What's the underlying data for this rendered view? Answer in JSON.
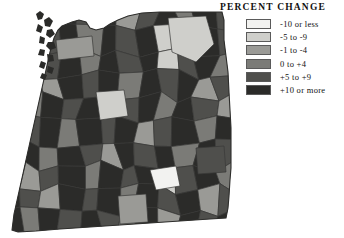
{
  "legend": {
    "title": "PERCENT CHANGE",
    "classes": [
      {
        "label": "-10 or less",
        "color": "#f2f2f0",
        "key": "c1"
      },
      {
        "label": "-5 to -9",
        "color": "#cfcfcb",
        "key": "c2"
      },
      {
        "label": "-1 to -4",
        "color": "#9a9a96",
        "key": "c3"
      },
      {
        "label": "0 to +4",
        "color": "#7b7b77",
        "key": "c4"
      },
      {
        "label": "+5 to +9",
        "color": "#4f4f4c",
        "key": "c5"
      },
      {
        "label": "+10 or more",
        "color": "#2b2b29",
        "key": "c6"
      }
    ]
  },
  "map": {
    "region": "Pacific Northwest counties",
    "background": "#ffffff",
    "border_color": "#3a3a38",
    "chart_data": {
      "type": "map",
      "title": "PERCENT CHANGE",
      "classes": [
        "-10 or less",
        "-5 to -9",
        "-1 to -4",
        "0 to +4",
        "+5 to +9",
        "+10 or more"
      ],
      "class_colors": [
        "#f2f2f0",
        "#cfcfcb",
        "#9a9a96",
        "#7b7b77",
        "#4f4f4c",
        "#2b2b29"
      ],
      "legend_position": "top-right",
      "regions": [
        {
          "id": "r01",
          "class": 5
        },
        {
          "id": "r02",
          "class": 1
        },
        {
          "id": "r03",
          "class": 4
        },
        {
          "id": "r04",
          "class": 5
        },
        {
          "id": "r05",
          "class": 4
        },
        {
          "id": "r06",
          "class": 5
        },
        {
          "id": "r07",
          "class": 2
        },
        {
          "id": "r08",
          "class": 4
        },
        {
          "id": "r09",
          "class": 5
        },
        {
          "id": "r10",
          "class": 3
        },
        {
          "id": "r11",
          "class": 5
        },
        {
          "id": "r12",
          "class": 4
        },
        {
          "id": "r13",
          "class": 5
        },
        {
          "id": "r14",
          "class": 2
        },
        {
          "id": "r15",
          "class": 4
        },
        {
          "id": "r16",
          "class": 5
        },
        {
          "id": "r17",
          "class": 3
        },
        {
          "id": "r18",
          "class": 5
        },
        {
          "id": "r19",
          "class": 4
        },
        {
          "id": "r20",
          "class": 5
        },
        {
          "id": "r21",
          "class": 1
        },
        {
          "id": "r22",
          "class": 3
        },
        {
          "id": "r23",
          "class": 5
        },
        {
          "id": "r24",
          "class": 4
        },
        {
          "id": "r25",
          "class": 5
        },
        {
          "id": "r26",
          "class": 2
        },
        {
          "id": "r27",
          "class": 4
        },
        {
          "id": "r28",
          "class": 5
        },
        {
          "id": "r29",
          "class": 3
        },
        {
          "id": "r30",
          "class": 5
        },
        {
          "id": "r31",
          "class": 4
        },
        {
          "id": "r32",
          "class": 5
        },
        {
          "id": "r33",
          "class": 1
        },
        {
          "id": "r34",
          "class": 4
        },
        {
          "id": "r35",
          "class": 5
        },
        {
          "id": "r36",
          "class": 3
        },
        {
          "id": "r37",
          "class": 5
        },
        {
          "id": "r38",
          "class": 4
        },
        {
          "id": "r39",
          "class": 2
        },
        {
          "id": "r40",
          "class": 5
        },
        {
          "id": "r41",
          "class": 4
        },
        {
          "id": "r42",
          "class": 5
        },
        {
          "id": "r43",
          "class": 3
        },
        {
          "id": "r44",
          "class": 5
        },
        {
          "id": "r45",
          "class": 4
        },
        {
          "id": "r46",
          "class": 5
        },
        {
          "id": "r47",
          "class": 2
        },
        {
          "id": "r48",
          "class": 4
        },
        {
          "id": "r49",
          "class": 5
        },
        {
          "id": "r50",
          "class": 3
        },
        {
          "id": "r51",
          "class": 5
        },
        {
          "id": "r52",
          "class": 4
        },
        {
          "id": "r53",
          "class": 5
        },
        {
          "id": "r54",
          "class": 1
        },
        {
          "id": "r55",
          "class": 4
        },
        {
          "id": "r56",
          "class": 5
        },
        {
          "id": "r57",
          "class": 3
        },
        {
          "id": "r58",
          "class": 5
        },
        {
          "id": "r59",
          "class": 4
        },
        {
          "id": "r60",
          "class": 2
        },
        {
          "id": "r61",
          "class": 5
        },
        {
          "id": "r62",
          "class": 4
        },
        {
          "id": "r63",
          "class": 5
        },
        {
          "id": "r64",
          "class": 3
        },
        {
          "id": "r65",
          "class": 5
        },
        {
          "id": "r66",
          "class": 4
        },
        {
          "id": "r67",
          "class": 5
        },
        {
          "id": "r68",
          "class": 2
        },
        {
          "id": "r69",
          "class": 4
        },
        {
          "id": "r70",
          "class": 5
        },
        {
          "id": "r71",
          "class": 3
        },
        {
          "id": "r72",
          "class": 5
        },
        {
          "id": "r73",
          "class": 4
        },
        {
          "id": "r74",
          "class": 5
        },
        {
          "id": "r75",
          "class": 3
        },
        {
          "id": "r76",
          "class": 5
        },
        {
          "id": "r77",
          "class": 4
        },
        {
          "id": "r78",
          "class": 2
        },
        {
          "id": "r79",
          "class": 5
        },
        {
          "id": "r80",
          "class": 4
        },
        {
          "id": "r81",
          "class": 5
        },
        {
          "id": "r82",
          "class": 3
        },
        {
          "id": "r83",
          "class": 5
        },
        {
          "id": "r84",
          "class": 4
        },
        {
          "id": "r85",
          "class": 5
        },
        {
          "id": "r86",
          "class": 2
        },
        {
          "id": "r87",
          "class": 4
        },
        {
          "id": "r88",
          "class": 5
        },
        {
          "id": "r89",
          "class": 3
        },
        {
          "id": "r90",
          "class": 5
        },
        {
          "id": "r91",
          "class": 4
        },
        {
          "id": "r92",
          "class": 5
        },
        {
          "id": "r93",
          "class": 1
        },
        {
          "id": "r94",
          "class": 4
        },
        {
          "id": "r95",
          "class": 5
        },
        {
          "id": "r96",
          "class": 3
        },
        {
          "id": "r97",
          "class": 5
        },
        {
          "id": "r98",
          "class": 4
        },
        {
          "id": "r99",
          "class": 2
        },
        {
          "id": "r100",
          "class": 5
        },
        {
          "id": "r101",
          "class": 4
        },
        {
          "id": "r102",
          "class": 5
        },
        {
          "id": "r103",
          "class": 3
        },
        {
          "id": "r104",
          "class": 5
        },
        {
          "id": "r105",
          "class": 4
        },
        {
          "id": "r106",
          "class": 5
        },
        {
          "id": "r107",
          "class": 2
        },
        {
          "id": "r108",
          "class": 4
        },
        {
          "id": "r109",
          "class": 5
        },
        {
          "id": "r110",
          "class": 3
        },
        {
          "id": "r111",
          "class": 5
        },
        {
          "id": "r112",
          "class": 4
        },
        {
          "id": "r113",
          "class": 5
        },
        {
          "id": "r114",
          "class": 4
        },
        {
          "id": "r115",
          "class": 3
        },
        {
          "id": "r116",
          "class": 5
        },
        {
          "id": "r117",
          "class": 2
        },
        {
          "id": "r118",
          "class": 5
        },
        {
          "id": "r119",
          "class": 4
        },
        {
          "id": "r120",
          "class": 5
        }
      ]
    }
  }
}
